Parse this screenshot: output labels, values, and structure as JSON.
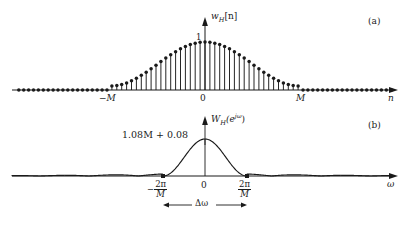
{
  "figure": {
    "background": "#ffffff",
    "ink": "#1a1a1a",
    "panels": [
      {
        "tag": "(a)",
        "tag_x": 370,
        "tag_y": 22,
        "type": "stem",
        "signal_label": "w",
        "signal_sub": "H",
        "signal_arg": "[n]",
        "xaxis_label": "n",
        "peak_label": "1",
        "xticks": [
          {
            "label": "−M",
            "x": 110
          },
          {
            "label": "0",
            "x": 205
          },
          {
            "label": "M",
            "x": 300
          }
        ],
        "baseline_y": 90,
        "origin_x": 205,
        "peak_y": 42,
        "stem_spacing": 4.9,
        "M_halfwidth": 95,
        "hamming_alpha": 0.54,
        "hamming_beta": 0.46,
        "pedestal": 0.0
      },
      {
        "tag": "(b)",
        "tag_x": 370,
        "tag_y": 126,
        "type": "line",
        "signal_label": "W",
        "signal_sub": "H",
        "signal_arg": "(e",
        "signal_exp": "jω",
        "signal_close": ")",
        "xaxis_label": "ω",
        "peak_label": "1.08M + 0.08",
        "peak_label_x": 122,
        "peak_label_y": 130,
        "xticks": [
          {
            "label_sign": "−",
            "num": "2π",
            "den": "M",
            "x": 163
          },
          {
            "label_sign": "",
            "num": "0",
            "den": "",
            "x": 205
          },
          {
            "label_sign": "",
            "num": "2π",
            "den": "M",
            "x": 247
          }
        ],
        "baseline_y": 176,
        "origin_x": 205,
        "peak_y": 139,
        "mainlobe_half": 42,
        "width_annotation": "Δω",
        "width_arrow_y": 205,
        "width_arrow_x1": 163,
        "width_arrow_x2": 247
      }
    ]
  },
  "chart_data": {
    "type": "line",
    "title": "",
    "subplots": [
      {
        "name": "Hamming window in time domain",
        "type": "stem",
        "xlabel": "n",
        "ylabel": "w_H[n]",
        "ytick_labels": [
          "1"
        ],
        "xtick_labels": [
          "-M",
          "0",
          "M"
        ],
        "description": "Hamming window w_H[n] = 0.54 + 0.46 cos(pi n / M) for |n| <= M, zero elsewhere; unity peak at n = 0",
        "peak_value": 1,
        "support": [
          -95,
          95
        ],
        "x": [
          -95,
          -90,
          -85,
          -80,
          -75,
          -70,
          -65,
          -60,
          -55,
          -50,
          -45,
          -40,
          -35,
          -30,
          -25,
          -20,
          -15,
          -10,
          -5,
          0,
          5,
          10,
          15,
          20,
          25,
          30,
          35,
          40,
          45,
          50,
          55,
          60,
          65,
          70,
          75,
          80,
          85,
          90,
          95
        ],
        "values": [
          0.08,
          0.087,
          0.108,
          0.142,
          0.19,
          0.25,
          0.321,
          0.401,
          0.488,
          0.58,
          0.674,
          0.767,
          0.856,
          0.937,
          1.0,
          1.0,
          1.0,
          1.0,
          1.0,
          1.0,
          1.0,
          1.0,
          1.0,
          1.0,
          1.0,
          0.937,
          0.856,
          0.767,
          0.674,
          0.58,
          0.488,
          0.401,
          0.321,
          0.25,
          0.19,
          0.142,
          0.108,
          0.087,
          0.08
        ]
      },
      {
        "name": "Hamming window Fourier transform magnitude",
        "type": "line",
        "xlabel": "ω",
        "ylabel": "W_H(e^{jω})",
        "ytick_labels": [
          "1.08M + 0.08"
        ],
        "xtick_labels": [
          "-2π/M",
          "0",
          "2π/M"
        ],
        "description": "Main lobe of the Hamming window DTFT, peak value 1.08M + 0.08 at ω = 0, first nulls at ω = ±2π/M, mainlobe width Δω = 4π/M",
        "peak_value_label": "1.08M + 0.08",
        "nulls": [
          "-2π/M",
          "2π/M"
        ],
        "mainlobe_width_label": "Δω",
        "xlim": [
          "-π",
          "π"
        ],
        "grid": false,
        "legend": "none"
      }
    ]
  }
}
